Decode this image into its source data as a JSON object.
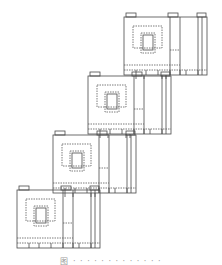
{
  "figure": {
    "line_color": "#4a4a4a",
    "dash_color": "#5a5a5a",
    "blocks": [
      {
        "id": 1,
        "x": 124,
        "y": 17
      },
      {
        "id": 2,
        "x": 88,
        "y": 76
      },
      {
        "id": 3,
        "x": 53,
        "y": 135
      },
      {
        "id": 4,
        "x": 17,
        "y": 190
      }
    ],
    "block_width": 83,
    "block_height": 58
  },
  "caption": {
    "text": "图 · · ·  · · · · · · · · · ·"
  }
}
